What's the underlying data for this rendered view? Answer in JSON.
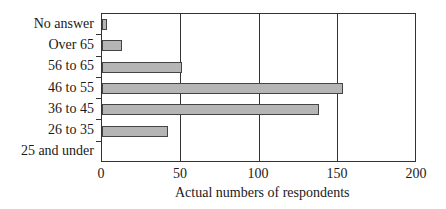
{
  "chart_data": {
    "type": "bar",
    "orientation": "horizontal",
    "categories": [
      "No answer",
      "Over 65",
      "56 to 65",
      "46 to 55",
      "36 to 45",
      "26 to 35",
      "25 and under"
    ],
    "values": [
      3,
      13,
      51,
      153,
      138,
      42,
      0
    ],
    "title": "",
    "xlabel": "Actual numbers of respondents",
    "ylabel": "",
    "xlim": [
      0,
      200
    ],
    "xticks": [
      "0",
      "50",
      "100",
      "150",
      "200"
    ],
    "grid": true,
    "legend": null,
    "bar_color": "#b5b5b5"
  }
}
